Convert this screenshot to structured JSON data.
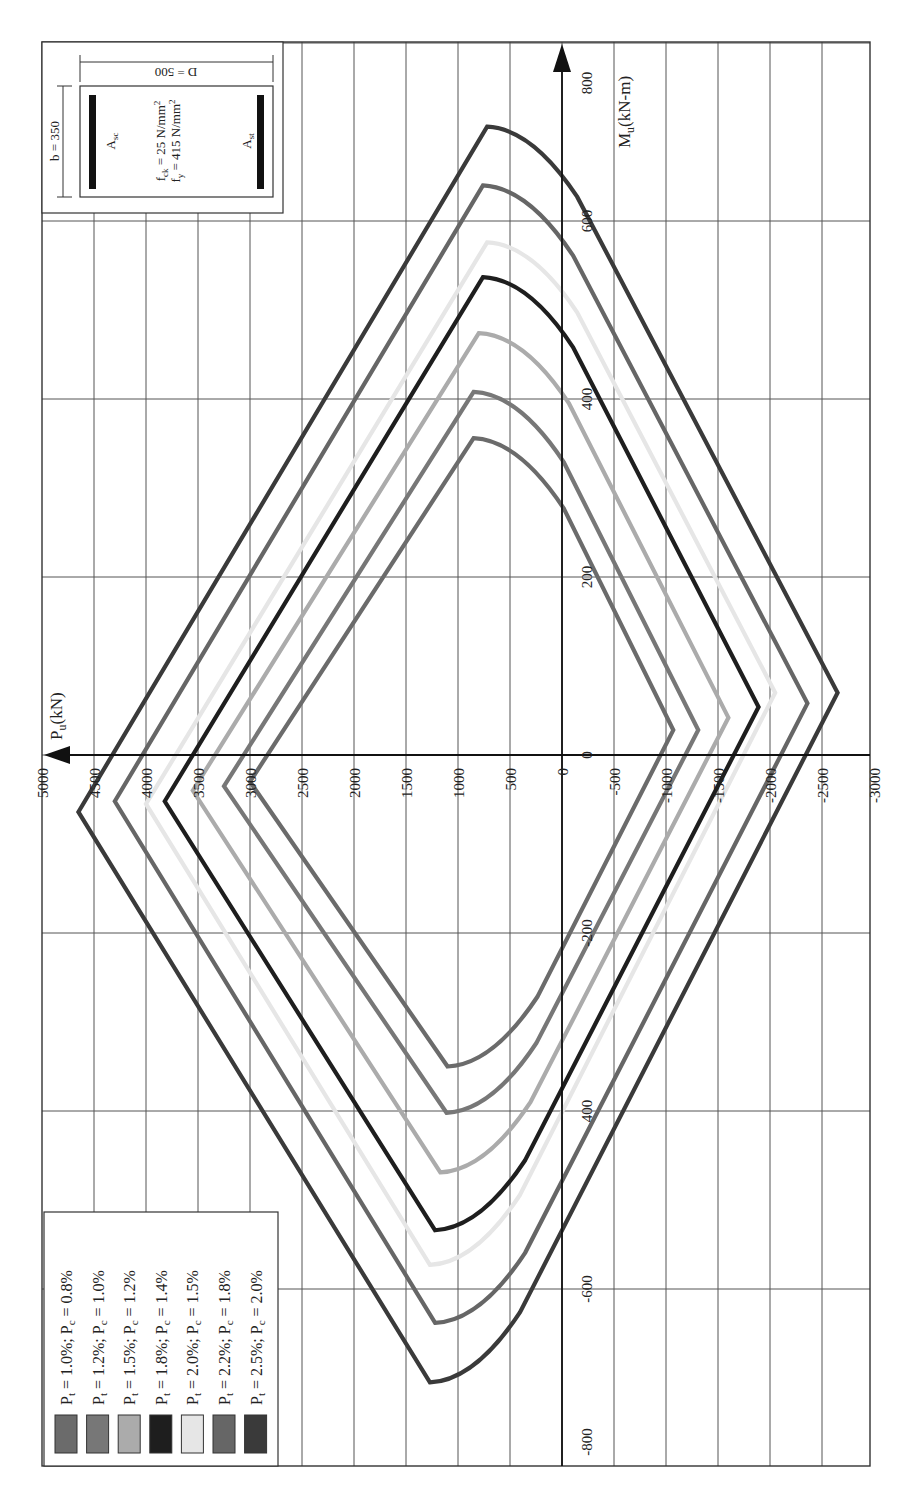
{
  "chart_data": {
    "type": "line",
    "xlabel": "P_u(kN)",
    "ylabel": "M_u(kN-m)",
    "p_axis": {
      "label": "P",
      "label_sub": "u",
      "label_unit": "(kN)",
      "ticks": [
        5000,
        4500,
        4000,
        3500,
        3000,
        2500,
        2000,
        1500,
        1000,
        500,
        0,
        -500,
        -1000,
        -1500,
        -2000,
        -2500,
        -3000
      ],
      "range": [
        5000,
        -3000
      ]
    },
    "m_axis": {
      "label": "M",
      "label_sub": "u",
      "label_unit": "(kN-m)",
      "ticks": [
        800,
        600,
        400,
        200,
        0,
        -200,
        -400,
        -600,
        -800
      ],
      "tick_labels": [
        "800",
        "600",
        "400",
        "200",
        "0",
        "-200",
        "400",
        "-600",
        "-800"
      ],
      "range": [
        800,
        -800
      ]
    },
    "grid": true,
    "legend_position": "bottom-left",
    "series": [
      {
        "name": "Pt = 1.0%; Pc = 0.8%",
        "pt": "1.0%",
        "pc": "0.8%",
        "color": "#6b6b6b",
        "p_max": 3000,
        "m_at_p_max": -30,
        "p_top": 850,
        "m_top": 356,
        "p_min": -1070,
        "m_at_p_min": 28,
        "p_bot": 1100,
        "m_bot": -350
      },
      {
        "name": "Pt = 1.2%; Pc = 1.0%",
        "pt": "1.2%",
        "pc": "1.0%",
        "color": "#777777",
        "p_max": 3250,
        "m_at_p_max": -35,
        "p_top": 850,
        "m_top": 408,
        "p_min": -1310,
        "m_at_p_min": 28,
        "p_bot": 1110,
        "m_bot": -402
      },
      {
        "name": "Pt = 1.5%; Pc = 1.2%",
        "pt": "1.5%",
        "pc": "1.2%",
        "color": "#ababab",
        "p_max": 3550,
        "m_at_p_max": -40,
        "p_top": 800,
        "m_top": 474,
        "p_min": -1600,
        "m_at_p_min": 42,
        "p_bot": 1170,
        "m_bot": -469
      },
      {
        "name": "Pt = 1.8%; Pc = 1.4%",
        "pt": "1.8%",
        "pc": "1.4%",
        "color": "#1e1e1e",
        "p_max": 3820,
        "m_at_p_max": -52,
        "p_top": 760,
        "m_top": 537,
        "p_min": -1890,
        "m_at_p_min": 54,
        "p_bot": 1220,
        "m_bot": -534
      },
      {
        "name": "Pt = 2.0%; Pc = 1.5%",
        "pt": "2.0%",
        "pc": "1.5%",
        "color": "#e6e6e6",
        "p_max": 4000,
        "m_at_p_max": -55,
        "p_top": 720,
        "m_top": 576,
        "p_min": -2050,
        "m_at_p_min": 70,
        "p_bot": 1270,
        "m_bot": -573
      },
      {
        "name": "Pt = 2.2%; Pc = 1.8%",
        "pt": "2.2%",
        "pc": "1.8%",
        "color": "#666666",
        "p_max": 4300,
        "m_at_p_max": -52,
        "p_top": 760,
        "m_top": 640,
        "p_min": -2360,
        "m_at_p_min": 58,
        "p_bot": 1220,
        "m_bot": -638
      },
      {
        "name": "Pt = 2.5%; Pc = 2.0%",
        "pt": "2.5%",
        "pc": "2.0%",
        "color": "#3a3a3a",
        "p_max": 4650,
        "m_at_p_max": -64,
        "p_top": 720,
        "m_top": 706,
        "p_min": -2650,
        "m_at_p_min": 70,
        "p_bot": 1270,
        "m_bot": -705
      }
    ],
    "annotations": {
      "section": {
        "b": "b = 350",
        "D": "D = 500",
        "asc": "A",
        "asc_sub": "sc",
        "ast": "A",
        "ast_sub": "st",
        "fck": "f",
        "fck_sub": "ck",
        "fck_val": " = 25 N/mm",
        "fy": "f",
        "fy_sub": "y",
        "fy_val": " = 415 N/mm",
        "sup": "2"
      }
    }
  },
  "legend": {
    "items": [
      {
        "pt_label": "P",
        "pt_sub": "t",
        "pt_val": " = 1.0%; ",
        "pc_label": "P",
        "pc_sub": "c",
        "pc_val": " = 0.8%"
      },
      {
        "pt_label": "P",
        "pt_sub": "t",
        "pt_val": " = 1.2%; ",
        "pc_label": "P",
        "pc_sub": "c",
        "pc_val": " = 1.0%"
      },
      {
        "pt_label": "P",
        "pt_sub": "t",
        "pt_val": " = 1.5%; ",
        "pc_label": "P",
        "pc_sub": "c",
        "pc_val": " = 1.2%"
      },
      {
        "pt_label": "P",
        "pt_sub": "t",
        "pt_val": " = 1.8%; ",
        "pc_label": "P",
        "pc_sub": "c",
        "pc_val": " = 1.4%"
      },
      {
        "pt_label": "P",
        "pt_sub": "t",
        "pt_val": " = 2.0%; ",
        "pc_label": "P",
        "pc_sub": "c",
        "pc_val": " = 1.5%"
      },
      {
        "pt_label": "P",
        "pt_sub": "t",
        "pt_val": " = 2.2%; ",
        "pc_label": "P",
        "pc_sub": "c",
        "pc_val": " = 1.8%"
      },
      {
        "pt_label": "P",
        "pt_sub": "t",
        "pt_val": " = 2.5%; ",
        "pc_label": "P",
        "pc_sub": "c",
        "pc_val": " = 2.0%"
      }
    ]
  }
}
